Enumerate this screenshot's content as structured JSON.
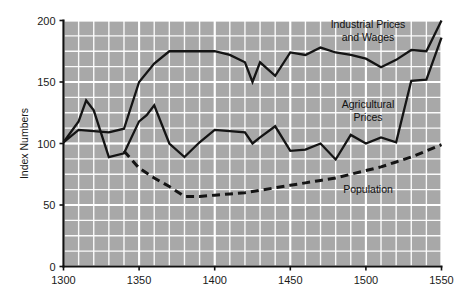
{
  "chart_data": {
    "type": "line",
    "title": "",
    "xlabel": "",
    "ylabel": "Index Numbers",
    "xlim": [
      1300,
      1550
    ],
    "ylim": [
      0,
      200
    ],
    "xticks": [
      1300,
      1350,
      1400,
      1450,
      1500,
      1550
    ],
    "yticks": [
      0,
      50,
      100,
      150,
      200
    ],
    "grid": true,
    "grid_minor_x_step": 10,
    "grid_minor_y_step": 12.5,
    "legend_position": "inline-annotations",
    "plot_background_color": "#a8a8a8",
    "grid_color": "#ffffff",
    "line_color": "#141414",
    "series": [
      {
        "name": "Industrial Prices and Wages",
        "style": "solid",
        "label_lines": [
          "Industrial Prices",
          "and Wages"
        ],
        "x": [
          1300,
          1310,
          1320,
          1330,
          1340,
          1350,
          1360,
          1370,
          1380,
          1390,
          1400,
          1410,
          1420,
          1425,
          1430,
          1440,
          1450,
          1460,
          1470,
          1480,
          1490,
          1500,
          1510,
          1520,
          1530,
          1540,
          1550
        ],
        "values": [
          101,
          111,
          110,
          109,
          112,
          150,
          165,
          175,
          175,
          175,
          175,
          172,
          166,
          150,
          166,
          155,
          174,
          172,
          178,
          174,
          172,
          169,
          162,
          168,
          176,
          175,
          200
        ]
      },
      {
        "name": "Agricultural Prices",
        "style": "solid",
        "label_lines": [
          "Agricultural",
          "Prices"
        ],
        "x": [
          1300,
          1310,
          1315,
          1320,
          1330,
          1340,
          1350,
          1355,
          1360,
          1370,
          1380,
          1390,
          1400,
          1410,
          1420,
          1425,
          1430,
          1440,
          1450,
          1460,
          1470,
          1480,
          1490,
          1500,
          1510,
          1520,
          1530,
          1540,
          1550
        ],
        "values": [
          101,
          118,
          135,
          127,
          89,
          92,
          118,
          123,
          131,
          100,
          89,
          101,
          111,
          110,
          109,
          100,
          105,
          114,
          94,
          95,
          100,
          87,
          107,
          100,
          105,
          101,
          151,
          152,
          186
        ]
      },
      {
        "name": "Population",
        "style": "dashed",
        "label_lines": [
          "Population"
        ],
        "x": [
          1340,
          1350,
          1355,
          1360,
          1370,
          1380,
          1390,
          1400,
          1410,
          1420,
          1430,
          1440,
          1450,
          1460,
          1470,
          1480,
          1490,
          1500,
          1510,
          1520,
          1530,
          1540,
          1550
        ],
        "values": [
          94,
          80,
          76,
          72,
          65,
          57,
          57,
          58,
          59,
          60,
          62,
          64,
          66,
          68,
          70,
          72,
          75,
          78,
          81,
          85,
          89,
          94,
          99
        ]
      }
    ],
    "annotations": [
      {
        "id": "industrial",
        "text_lines": [
          "Industrial Prices",
          "and Wages"
        ],
        "x_px": 368,
        "y_px": 28
      },
      {
        "id": "agricultural",
        "text_lines": [
          "Agricultural",
          "Prices"
        ],
        "x_px": 368,
        "y_px": 108
      },
      {
        "id": "population",
        "text_lines": [
          "Population"
        ],
        "x_px": 368,
        "y_px": 193
      }
    ]
  }
}
